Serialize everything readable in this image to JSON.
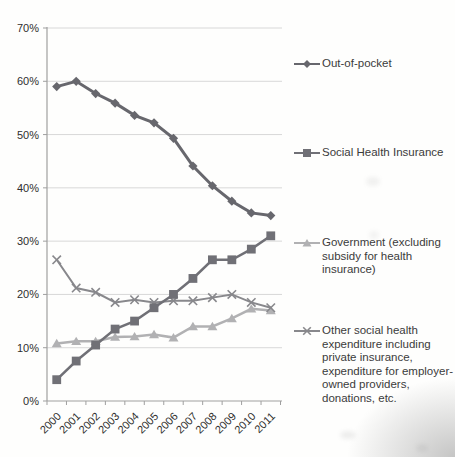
{
  "chart_data": {
    "type": "line",
    "title": "",
    "xlabel": "",
    "ylabel": "",
    "x_labels": [
      "2000",
      "2001",
      "2002",
      "2003",
      "2004",
      "2005",
      "2006",
      "2007",
      "2008",
      "2009",
      "2010",
      "2011"
    ],
    "y_tick_labels": [
      "0%",
      "10%",
      "20%",
      "30%",
      "40%",
      "50%",
      "60%",
      "70%"
    ],
    "ylim": [
      0,
      70
    ],
    "y_tick_step": 10,
    "grid": true,
    "legend_position": "right",
    "axis_color": "#9f9f9f",
    "grid_color": "#d8d8d8",
    "series": [
      {
        "name": "Out-of-pocket",
        "marker": "diamond",
        "color": "#67676d",
        "line_width": 3,
        "values": [
          59.0,
          60.0,
          57.7,
          55.9,
          53.6,
          52.2,
          49.3,
          44.1,
          40.4,
          37.5,
          35.3,
          34.8
        ]
      },
      {
        "name": "Social Health Insurance",
        "marker": "square",
        "color": "#707076",
        "line_width": 2.5,
        "values": [
          4.0,
          7.5,
          10.5,
          13.5,
          15.0,
          17.5,
          20.0,
          23.0,
          26.5,
          26.5,
          28.5,
          31.0
        ]
      },
      {
        "name": "Government (excluding subsidy for health insurance)",
        "marker": "triangle",
        "color": "#b1b1b3",
        "line_width": 2.5,
        "values": [
          10.8,
          11.2,
          11.2,
          12.0,
          12.1,
          12.5,
          11.9,
          14.0,
          14.0,
          15.5,
          17.3,
          17.0
        ]
      },
      {
        "name": "Other social health expenditure including private insurance, expenditure for employer-owned providers, donations, etc.",
        "marker": "x",
        "color": "#88888c",
        "line_width": 2,
        "values": [
          26.5,
          21.2,
          20.4,
          18.5,
          19.0,
          18.5,
          18.8,
          18.8,
          19.4,
          20.0,
          18.5,
          17.5
        ]
      }
    ]
  }
}
